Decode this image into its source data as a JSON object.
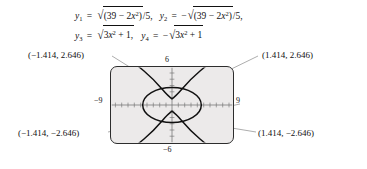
{
  "figure": {
    "type": "graphing-calculator-figure",
    "equations": {
      "line1": {
        "eq1": {
          "lhs": "y",
          "sub": "1",
          "rel": "=",
          "radicand": "(39 − 2x²)/5",
          "negated": false,
          "text": "y₁ = √((39 − 2x²)/5),"
        },
        "eq2": {
          "lhs": "y",
          "sub": "2",
          "rel": "=",
          "radicand": "(39 − 2x²)/5",
          "negated": true,
          "text": "y₂ = −√((39 − 2x²)/5),"
        }
      },
      "line2": {
        "eq3": {
          "lhs": "y",
          "sub": "3",
          "rel": "=",
          "radicand": "3x² + 1",
          "negated": false,
          "text": "y₃ = √(3x² + 1),"
        },
        "eq4": {
          "lhs": "y",
          "sub": "4",
          "rel": "=",
          "radicand": "3x² + 1",
          "negated": true,
          "text": "y₄ = −√(3x² + 1)"
        }
      },
      "pieces": {
        "y1": "y",
        "s1": "1",
        "y2": "y",
        "s2": "2",
        "y3": "y",
        "s3": "3",
        "y4": "y",
        "s4": "4",
        "equals": "=",
        "minus": "−",
        "radical": "√",
        "num_39": "39",
        "minus_mid": "−",
        "coef2": "2",
        "x": "x",
        "sq": "2",
        "open": "(",
        "close": ")",
        "over5": "/5,",
        "over5_end": "/5,",
        "coef3": "3",
        "plus1": "+ 1,",
        "plus1_end": "+ 1"
      }
    },
    "screen": {
      "axis_labels": {
        "top": "6",
        "bottom": "−6",
        "left": "−9",
        "right": "9"
      },
      "window": {
        "xmin": -9,
        "xmax": 9,
        "ymin": -6,
        "ymax": 6
      },
      "curves": [
        {
          "name": "ellipse",
          "equation": "2x² + 5y² = 39"
        },
        {
          "name": "hyperbola",
          "equation": "y² − 3x² = 1"
        }
      ]
    },
    "callouts": {
      "top_left": "(−1.414, 2.646)",
      "top_right": "(1.414, 2.646)",
      "bottom_left": "(−1.414, −2.646)",
      "bottom_right": "(1.414, −2.646)"
    },
    "colors": {
      "screen_bg": "#eceaea",
      "screen_border": "#2d2d2d",
      "curve": "#111111",
      "axis": "#6b6b6b",
      "leader": "#8a8a8a",
      "text": "#111111"
    }
  }
}
